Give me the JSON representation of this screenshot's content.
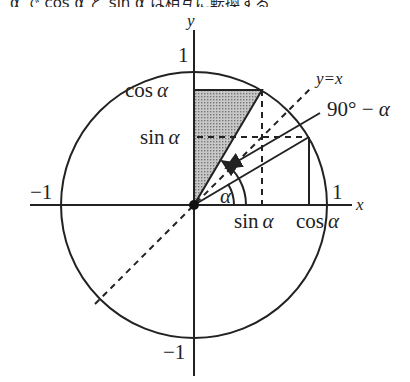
{
  "caption": "α で cos α と sin α は相互に転換する",
  "diagram": {
    "axes": {
      "x_label": "x",
      "y_label": "y"
    },
    "ticks": {
      "pos_x": "1",
      "neg_x": "−1",
      "pos_y": "1",
      "neg_y": "−1"
    },
    "labels": {
      "cos_y": "cos",
      "sin_y": "sin",
      "sin_x": "sin",
      "cos_x": "cos",
      "alpha": "α",
      "line": "y=x",
      "complement": "90° − ",
      "complement_alpha": "α"
    },
    "colors": {
      "stroke": "#222222",
      "shade": "#b5b5b5",
      "background": "#ffffff"
    },
    "geometry": {
      "center": [
        194,
        205
      ],
      "radius": 133,
      "alpha_deg": 30.6
    }
  }
}
